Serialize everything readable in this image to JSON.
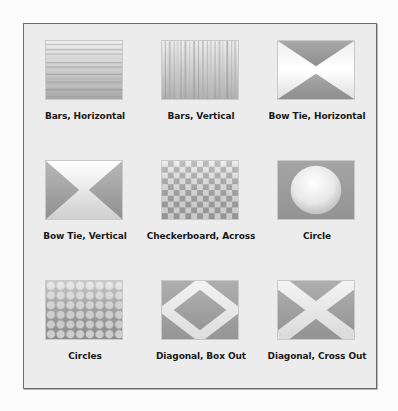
{
  "panel": {
    "title": "",
    "items": [
      {
        "label": "Bars, Horizontal",
        "icon": "bars-horizontal-icon"
      },
      {
        "label": "Bars, Vertical",
        "icon": "bars-vertical-icon"
      },
      {
        "label": "Bow Tie, Horizontal",
        "icon": "bow-tie-horizontal-icon"
      },
      {
        "label": "Bow Tie, Vertical",
        "icon": "bow-tie-vertical-icon"
      },
      {
        "label": "Checkerboard, Across",
        "icon": "checkerboard-across-icon"
      },
      {
        "label": "Circle",
        "icon": "circle-icon"
      },
      {
        "label": "Circles",
        "icon": "circles-icon"
      },
      {
        "label": "Diagonal, Box Out",
        "icon": "diagonal-box-out-icon"
      },
      {
        "label": "Diagonal, Cross Out",
        "icon": "diagonal-cross-out-icon"
      }
    ]
  },
  "colors": {
    "background": "#fbfbfb",
    "panel": "#ececec",
    "border": "#6a6a6a",
    "thumb_light": "#f4f4f4",
    "thumb_dark": "#9a9a9a",
    "label": "#1a1a1a"
  }
}
